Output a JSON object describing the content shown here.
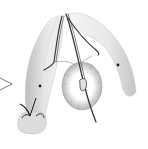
{
  "image": {
    "description": "Scientific engraving of an anatomical specimen with two lobes, a radial ribbed disc, paired tubular structures and a pointer arrow",
    "colors": {
      "background": "#ffffff",
      "shading": "#c8c8c8",
      "ink": "#3a3a3a",
      "dark_ink": "#1e1e1e"
    }
  }
}
